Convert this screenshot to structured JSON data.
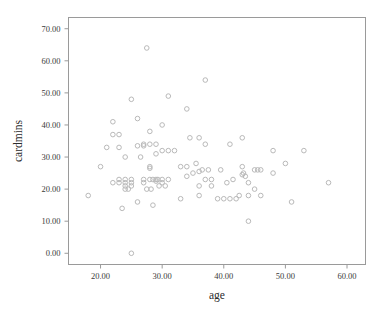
{
  "chart_data": {
    "type": "scatter",
    "title": "",
    "xlabel": "age",
    "ylabel": "cardmins",
    "xlim": [
      14.8,
      63.0
    ],
    "ylim": [
      -3.5,
      73.5
    ],
    "xticks": [
      20,
      30,
      40,
      50,
      60
    ],
    "xtick_labels": [
      "20.00",
      "30.00",
      "40.00",
      "50.00",
      "60.00"
    ],
    "yticks": [
      0,
      10,
      20,
      30,
      40,
      50,
      60,
      70
    ],
    "ytick_labels": [
      "0.00",
      "10.00",
      "20.00",
      "30.00",
      "40.00",
      "50.00",
      "60.00",
      "70.00"
    ],
    "grid": false,
    "legend": "none",
    "marker": "open-circle",
    "marker_color": "#b9b9b9",
    "frame_color": "#9a9a9a",
    "x": [
      18,
      20,
      21,
      22,
      22,
      22,
      23,
      23,
      23,
      23,
      23.5,
      24,
      24,
      24,
      24,
      24,
      24.5,
      25,
      25,
      25,
      25,
      25,
      26,
      26,
      26,
      26.5,
      27,
      27,
      27,
      27,
      27.5,
      27.5,
      28,
      28,
      28,
      28,
      28,
      28.2,
      28.5,
      28.5,
      29,
      29,
      29,
      29,
      29.3,
      29.5,
      30,
      30,
      30,
      30,
      30.5,
      31,
      31,
      31,
      32,
      33,
      33,
      34,
      34,
      34,
      34.5,
      35,
      35.5,
      36,
      36,
      36,
      36,
      36.5,
      37,
      37,
      37,
      37.5,
      38,
      38,
      39,
      39.5,
      40,
      40.5,
      41,
      41,
      41.5,
      42,
      42.5,
      43,
      43,
      43,
      43.2,
      43.5,
      44,
      44,
      44,
      45,
      45,
      45.5,
      46,
      46,
      48,
      48,
      50,
      51,
      53,
      57
    ],
    "y": [
      18,
      27,
      33,
      22,
      37,
      41,
      23,
      33,
      37,
      22,
      14,
      22,
      21,
      20,
      23,
      30,
      20,
      48,
      23,
      22,
      21,
      0,
      42,
      33.5,
      16,
      30,
      34,
      33.5,
      23,
      22,
      64,
      20,
      38,
      34,
      26.5,
      27,
      23,
      20,
      15,
      23,
      31,
      34,
      23,
      22.5,
      23,
      21,
      40,
      32,
      23,
      22,
      21,
      49,
      32,
      23,
      32,
      27,
      17,
      45,
      24,
      27,
      36,
      25,
      28,
      36,
      25.5,
      21,
      18,
      26,
      54,
      34,
      23,
      26,
      23,
      21,
      17,
      26,
      17,
      22,
      34,
      17,
      23,
      17,
      18,
      36,
      24.5,
      27,
      25,
      24,
      22,
      10,
      18,
      20,
      26,
      26,
      26,
      18,
      32,
      25,
      28,
      16,
      32,
      22
    ]
  },
  "axis": {
    "x_title": "age",
    "y_title": "cardmins"
  }
}
